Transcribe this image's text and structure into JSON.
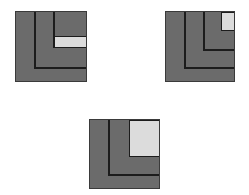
{
  "colors": {
    "background": "#ffffff",
    "dark_fill": "#6b6b6b",
    "light_fill": "#dcdcdc",
    "line": "#1c1c1c",
    "border": "#3a3a3a"
  },
  "figures": [
    {
      "id": "figure-1",
      "box": {
        "x": 15,
        "y": 11,
        "w": 72,
        "h": 71
      },
      "lines": [
        {
          "kind": "vertical",
          "x": 33,
          "y1": 11,
          "y2": 66
        },
        {
          "kind": "horizontal",
          "y": 66,
          "x1": 33,
          "x2": 87
        },
        {
          "kind": "vertical",
          "x": 52,
          "y1": 11,
          "y2": 47
        }
      ],
      "highlight": {
        "x": 53,
        "y": 35,
        "w": 34,
        "h": 12
      }
    },
    {
      "id": "figure-2",
      "box": {
        "x": 165,
        "y": 11,
        "w": 70,
        "h": 71
      },
      "lines": [
        {
          "kind": "vertical",
          "x": 183,
          "y1": 11,
          "y2": 66
        },
        {
          "kind": "horizontal",
          "y": 66,
          "x1": 183,
          "x2": 235
        },
        {
          "kind": "vertical",
          "x": 202,
          "y1": 11,
          "y2": 48
        },
        {
          "kind": "horizontal",
          "y": 48,
          "x1": 202,
          "x2": 235
        }
      ],
      "highlight": {
        "x": 220,
        "y": 11,
        "w": 15,
        "h": 19
      }
    },
    {
      "id": "figure-3",
      "box": {
        "x": 89,
        "y": 119,
        "w": 71,
        "h": 70
      },
      "lines": [
        {
          "kind": "vertical",
          "x": 107,
          "y1": 119,
          "y2": 173
        },
        {
          "kind": "horizontal",
          "y": 173,
          "x1": 107,
          "x2": 160
        }
      ],
      "highlight": {
        "x": 128,
        "y": 119,
        "w": 32,
        "h": 37
      }
    }
  ]
}
